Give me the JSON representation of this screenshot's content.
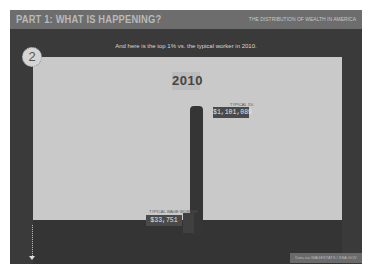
{
  "header": {
    "title": "PART 1: WHAT IS HAPPENING?",
    "subtitle": "THE DISTRIBUTION OF WEALTH IN AMERICA"
  },
  "slide": {
    "step_number": "2",
    "caption": "And here is the top 1% vs. the typical worker in 2010.",
    "year": "2010"
  },
  "chart_data": {
    "type": "bar",
    "title": "2010",
    "categories": [
      "Typical 1%",
      "Typical Wage Worker"
    ],
    "values": [
      1101089,
      33751
    ],
    "value_labels": [
      "$1,101,089",
      "$33,751"
    ]
  },
  "labels": {
    "top_small": "TYPICAL 1%",
    "top_value": "$1,101,089",
    "bottom_small": "TYPICAL WAGE WORKER",
    "bottom_value": "$33,751"
  },
  "footer": {
    "source": "Data via WAGESTATS / SSA.GOV"
  }
}
